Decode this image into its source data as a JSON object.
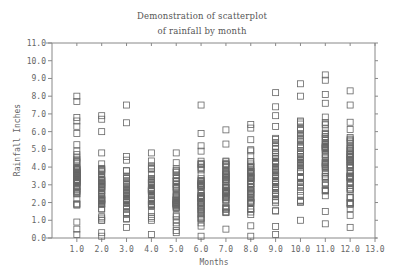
{
  "chart_data": {
    "type": "scatter",
    "title": "Demonstration of scatterplot",
    "subtitle": "of rainfall by month",
    "xlabel": "Months",
    "ylabel": "Rainfall Inches",
    "xlim": [
      0.0,
      13.0
    ],
    "ylim": [
      0.0,
      11.0
    ],
    "x_ticks": [
      "1.0",
      "2.0",
      "3.0",
      "4.0",
      "5.0",
      "6.0",
      "7.0",
      "8.0",
      "9.0",
      "10.0",
      "11.0",
      "12.0",
      "13.0"
    ],
    "y_ticks": [
      "0.0",
      "1.0",
      "2.0",
      "3.0",
      "4.0",
      "5.0",
      "6.0",
      "7.0",
      "8.0",
      "9.0",
      "10.0",
      "11.0"
    ],
    "grid": false,
    "legend": null,
    "marker": "open-square",
    "series": [
      {
        "month": 1,
        "outliers": [
          8.0,
          7.7,
          6.8,
          6.6,
          6.3
        ],
        "dense_range": [
          0.9,
          5.9
        ],
        "low_points": [
          0.2,
          0.5
        ],
        "count": 60
      },
      {
        "month": 2,
        "outliers": [
          6.9,
          6.7,
          6.0
        ],
        "dense_range": [
          0.3,
          4.8
        ],
        "low_points": [
          0.1
        ],
        "count": 55
      },
      {
        "month": 3,
        "outliers": [
          7.5,
          6.5
        ],
        "dense_range": [
          0.6,
          4.6
        ],
        "low_points": [],
        "count": 50
      },
      {
        "month": 4,
        "outliers": [],
        "dense_range": [
          0.2,
          4.8
        ],
        "low_points": [],
        "count": 55
      },
      {
        "month": 5,
        "outliers": [],
        "dense_range": [
          0.3,
          4.8
        ],
        "low_points": [],
        "count": 50
      },
      {
        "month": 6,
        "outliers": [
          7.5,
          5.9,
          5.2
        ],
        "dense_range": [
          0.1,
          4.9
        ],
        "low_points": [],
        "count": 55
      },
      {
        "month": 7,
        "outliers": [
          6.1
        ],
        "dense_range": [
          0.5,
          5.3
        ],
        "low_points": [],
        "count": 55
      },
      {
        "month": 8,
        "outliers": [
          6.4
        ],
        "dense_range": [
          0.1,
          6.2
        ],
        "low_points": [],
        "count": 60
      },
      {
        "month": 9,
        "outliers": [
          8.2,
          7.4
        ],
        "dense_range": [
          0.2,
          6.9
        ],
        "low_points": [],
        "count": 60
      },
      {
        "month": 10,
        "outliers": [
          8.7
        ],
        "dense_range": [
          1.0,
          8.0
        ],
        "low_points": [],
        "count": 60
      },
      {
        "month": 11,
        "outliers": [
          9.2,
          8.9,
          8.1
        ],
        "dense_range": [
          1.5,
          7.6
        ],
        "low_points": [
          0.8
        ],
        "count": 60
      },
      {
        "month": 12,
        "outliers": [
          8.3
        ],
        "dense_range": [
          0.6,
          7.5
        ],
        "low_points": [],
        "count": 60
      }
    ],
    "colors": {
      "axis": "#888888",
      "marker": "#666666",
      "text": "#666666"
    }
  }
}
